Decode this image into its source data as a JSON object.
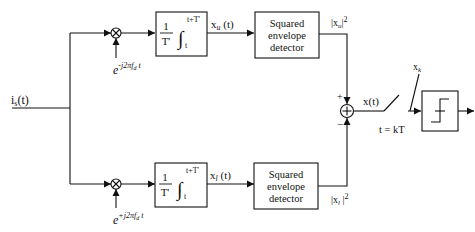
{
  "diagram": {
    "type": "block-diagram",
    "input": {
      "label": "i",
      "sub": "s",
      "arg": "(t)"
    },
    "upper_branch": {
      "oscillator": {
        "base": "e",
        "exponent": "-j2πf",
        "exp_sub": "d",
        "exp_tail": " t"
      },
      "integrator": {
        "frac_num": "1",
        "frac_den": "T'",
        "upper_limit": "t+T'",
        "lower_limit": "t"
      },
      "integrator_output": {
        "label": "x",
        "sub": "u",
        "arg": " (t)"
      },
      "detector": {
        "line1": "Squared",
        "line2": "envelope",
        "line3": "detector"
      },
      "detector_output": {
        "prefix": "|x",
        "sub": "u",
        "suffix": "|",
        "power": "2"
      }
    },
    "lower_branch": {
      "oscillator": {
        "base": "e",
        "exponent": "+j2πf",
        "exp_sub": "d",
        "exp_tail": " t"
      },
      "integrator": {
        "frac_num": "1",
        "frac_den": "T'",
        "upper_limit": "t+T'",
        "lower_limit": "t"
      },
      "integrator_output": {
        "label": "x",
        "sub": "l",
        "arg": " (t)"
      },
      "detector": {
        "line1": "Squared",
        "line2": "envelope",
        "line3": "detector"
      },
      "detector_output": {
        "prefix": "|x",
        "sub": "l",
        "suffix": " |",
        "power": "2"
      }
    },
    "summer": {
      "plus": "+",
      "minus": "−",
      "output": "x(t)"
    },
    "sampler": {
      "label": "t = kT",
      "sample": "x",
      "sample_sub": "k"
    },
    "decision": {
      "name": "threshold"
    }
  },
  "colors": {
    "line": "#111111",
    "background": "#ffffff"
  }
}
